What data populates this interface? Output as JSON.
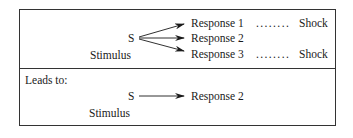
{
  "top_panel": {
    "stimulus_symbol": "S",
    "stimulus_label": "Stimulus",
    "responses": [
      {
        "label": "Response 1",
        "leader": "........",
        "outcome": "Shock"
      },
      {
        "label": "Response 2",
        "leader": "",
        "outcome": ""
      },
      {
        "label": "Response 3",
        "leader": "........",
        "outcome": "Shock"
      }
    ]
  },
  "bottom_panel": {
    "heading": "Leads to:",
    "stimulus_symbol": "S",
    "stimulus_label": "Stimulus",
    "response": "Response 2"
  }
}
